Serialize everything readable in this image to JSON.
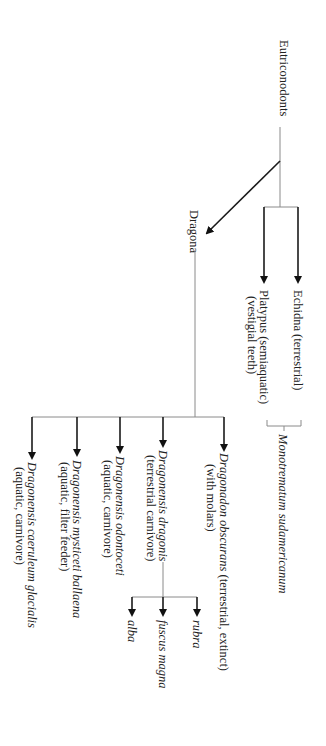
{
  "diagram": {
    "type": "phylogenetic-tree",
    "orientation": "rotated-90-clockwise",
    "root": {
      "label": "Eutriconodonts"
    },
    "monotremes": {
      "clade_label": "Monotrematum sudamericanum",
      "children": [
        {
          "name": "Echidna",
          "note": "(terrestrial)",
          "full": "Echidna (terrestrial)"
        },
        {
          "name": "Platypus",
          "note": "(semiaquatic)",
          "line1": "Platypus (semiaquatic)",
          "line2": "(vestigial teeth)"
        }
      ]
    },
    "dragona": {
      "label": "Dragona",
      "children": [
        {
          "genus_species": "Dragonadon obscurans",
          "line1_rest": " (terrestrial, extinct)",
          "line2": "(with molars)"
        },
        {
          "genus_species": "Dragonensis dragonis",
          "line2": "(terrestrial carnivore)",
          "subspecies": [
            "rubra",
            "fuscus magna",
            "alba"
          ]
        },
        {
          "genus_species": "Dragonensis odontoceti",
          "line2": "(aquatic, carnivore)"
        },
        {
          "genus_species": "Dragonensis mysticeti ballaena",
          "line2": "(aquatic, filter feeder)"
        },
        {
          "genus_species": "Dragonensis caeruleum glacialis",
          "line2": "(aquatic, carnivore)"
        }
      ]
    },
    "colors": {
      "thin_line": "#8a8a8a",
      "arrow": "#1a1a1a",
      "text": "#222222",
      "background": "#ffffff"
    }
  }
}
